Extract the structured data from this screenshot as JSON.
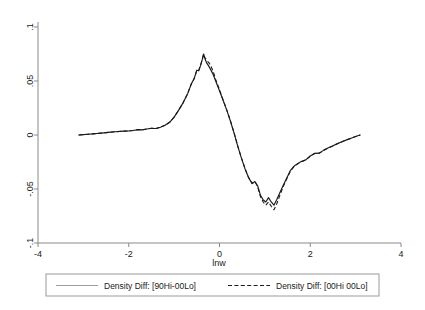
{
  "chart_data": {
    "type": "line",
    "title": "",
    "xlabel": "lnw",
    "ylabel": "",
    "xlim": [
      -4,
      4
    ],
    "ylim": [
      -0.1,
      0.1
    ],
    "grid": false,
    "legend_position": "bottom",
    "xticks": [
      "-4",
      "-2",
      "0",
      "2",
      "4"
    ],
    "xtick_values": [
      -4,
      -2,
      0,
      2,
      4
    ],
    "yticks": [
      ".1",
      ".05",
      "0",
      "-.05",
      "-.1"
    ],
    "ytick_values": [
      0.1,
      0.05,
      0,
      -0.05,
      -0.1
    ],
    "series": [
      {
        "name": "Density Diff: [90Hi-00Lo]",
        "style": "solid",
        "color": "#1a1a1a",
        "x": [
          -3.1,
          -3.0,
          -2.9,
          -2.8,
          -2.7,
          -2.6,
          -2.5,
          -2.4,
          -2.3,
          -2.2,
          -2.1,
          -2.0,
          -1.9,
          -1.8,
          -1.7,
          -1.6,
          -1.5,
          -1.4,
          -1.3,
          -1.2,
          -1.1,
          -1.0,
          -0.9,
          -0.8,
          -0.7,
          -0.62,
          -0.56,
          -0.5,
          -0.46,
          -0.42,
          -0.38,
          -0.35,
          -0.32,
          -0.28,
          -0.24,
          -0.2,
          -0.14,
          -0.08,
          0.0,
          0.08,
          0.16,
          0.24,
          0.32,
          0.4,
          0.48,
          0.56,
          0.64,
          0.72,
          0.78,
          0.84,
          0.9,
          0.96,
          1.02,
          1.08,
          1.14,
          1.2,
          1.26,
          1.32,
          1.4,
          1.48,
          1.56,
          1.64,
          1.72,
          1.8,
          1.9,
          2.0,
          2.1,
          2.2,
          2.3,
          2.4,
          2.5,
          2.6,
          2.7,
          2.8,
          2.9,
          3.0,
          3.1
        ],
        "y": [
          0.0,
          0.0004,
          0.0007,
          0.001,
          0.0014,
          0.0018,
          0.0022,
          0.0026,
          0.003,
          0.0033,
          0.0036,
          0.0038,
          0.0042,
          0.005,
          0.0048,
          0.0056,
          0.0062,
          0.006,
          0.0072,
          0.009,
          0.0118,
          0.0165,
          0.023,
          0.03,
          0.0385,
          0.0475,
          0.052,
          0.06,
          0.0595,
          0.064,
          0.07,
          0.075,
          0.0705,
          0.0665,
          0.064,
          0.061,
          0.056,
          0.0495,
          0.041,
          0.032,
          0.023,
          0.013,
          0.002,
          -0.01,
          -0.021,
          -0.031,
          -0.0395,
          -0.045,
          -0.043,
          -0.047,
          -0.0555,
          -0.06,
          -0.062,
          -0.058,
          -0.062,
          -0.065,
          -0.06,
          -0.0545,
          -0.047,
          -0.04,
          -0.033,
          -0.029,
          -0.0265,
          -0.0245,
          -0.023,
          -0.0195,
          -0.017,
          -0.0168,
          -0.014,
          -0.0118,
          -0.01,
          -0.008,
          -0.0062,
          -0.0045,
          -0.003,
          -0.0014,
          0.0
        ]
      },
      {
        "name": "Density Diff: [00Hi-00Lo]",
        "style": "dashed",
        "color": "#1a1a1a",
        "x": [
          -3.1,
          -3.0,
          -2.9,
          -2.8,
          -2.7,
          -2.6,
          -2.5,
          -2.4,
          -2.3,
          -2.2,
          -2.1,
          -2.0,
          -1.9,
          -1.8,
          -1.7,
          -1.6,
          -1.5,
          -1.4,
          -1.3,
          -1.2,
          -1.1,
          -1.0,
          -0.9,
          -0.8,
          -0.7,
          -0.62,
          -0.56,
          -0.5,
          -0.46,
          -0.42,
          -0.38,
          -0.35,
          -0.32,
          -0.28,
          -0.24,
          -0.2,
          -0.14,
          -0.08,
          0.0,
          0.08,
          0.16,
          0.24,
          0.32,
          0.4,
          0.48,
          0.56,
          0.64,
          0.72,
          0.78,
          0.84,
          0.9,
          0.96,
          1.02,
          1.08,
          1.14,
          1.2,
          1.26,
          1.32,
          1.4,
          1.48,
          1.56,
          1.64,
          1.72,
          1.8,
          1.9,
          2.0,
          2.1,
          2.2,
          2.3,
          2.4,
          2.5,
          2.6,
          2.7,
          2.8,
          2.9,
          3.0,
          3.1
        ],
        "y": [
          0.0,
          0.0004,
          0.0007,
          0.001,
          0.0014,
          0.0018,
          0.0022,
          0.0026,
          0.003,
          0.0033,
          0.0036,
          0.0038,
          0.0042,
          0.005,
          0.0048,
          0.0056,
          0.0062,
          0.006,
          0.0072,
          0.009,
          0.0118,
          0.0165,
          0.023,
          0.03,
          0.0385,
          0.0475,
          0.052,
          0.06,
          0.0595,
          0.064,
          0.07,
          0.0748,
          0.0715,
          0.069,
          0.0672,
          0.0648,
          0.059,
          0.051,
          0.042,
          0.0325,
          0.0232,
          0.0132,
          0.0022,
          -0.0098,
          -0.0208,
          -0.0308,
          -0.0392,
          -0.0448,
          -0.0432,
          -0.0478,
          -0.0568,
          -0.0618,
          -0.065,
          -0.062,
          -0.066,
          -0.0692,
          -0.064,
          -0.057,
          -0.0482,
          -0.0408,
          -0.0336,
          -0.0294,
          -0.0268,
          -0.0248,
          -0.0232,
          -0.0196,
          -0.0171,
          -0.0169,
          -0.0141,
          -0.0119,
          -0.0101,
          -0.0081,
          -0.0062,
          -0.0045,
          -0.003,
          -0.0014,
          0.0
        ]
      }
    ]
  },
  "legend": {
    "entries": [
      {
        "label": "Density Diff: [90Hi-00Lo]"
      },
      {
        "label": "Density Diff: [00Hi 00Lo]"
      }
    ]
  }
}
